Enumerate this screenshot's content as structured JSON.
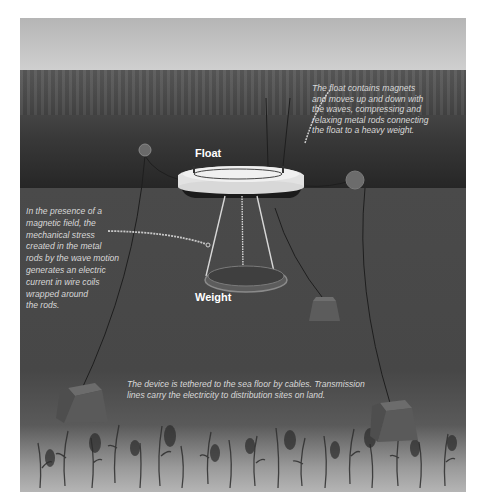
{
  "diagram": {
    "type": "wave-energy-device illustration",
    "labels": {
      "float": "Float",
      "weight": "Weight"
    },
    "callouts": {
      "float_description": {
        "lines": [
          "The float contains magnets",
          "and moves up and down with",
          "the waves, compressing and",
          "relaxing metal rods connecting",
          "the float to a heavy weight."
        ]
      },
      "magnetic_field": {
        "lines": [
          "In the presence of a",
          "magnetic field, the",
          "mechanical stress",
          "created  in the metal",
          "rods by the wave motion",
          "generates an electric",
          "current in wire coils",
          "wrapped around",
          "the rods."
        ]
      },
      "tether": {
        "lines": [
          "The device is tethered to the sea floor by cables. Transmission",
          "lines carry the electricity to distribution sites on land."
        ]
      }
    },
    "components": [
      "float",
      "weight",
      "metal-rods",
      "buoy-left",
      "buoy-right",
      "anchor-block-left",
      "anchor-block-center-right",
      "anchor-block-right",
      "cables",
      "seabed-vegetation"
    ],
    "colors": {
      "sky": "#c4c4c4",
      "sea_surface": "#3c3c3c",
      "underwater": "#4a4a4a",
      "seabed": "#b0b0b0",
      "float_body": "#e6e6e6",
      "text": "#d8d8d8"
    }
  }
}
